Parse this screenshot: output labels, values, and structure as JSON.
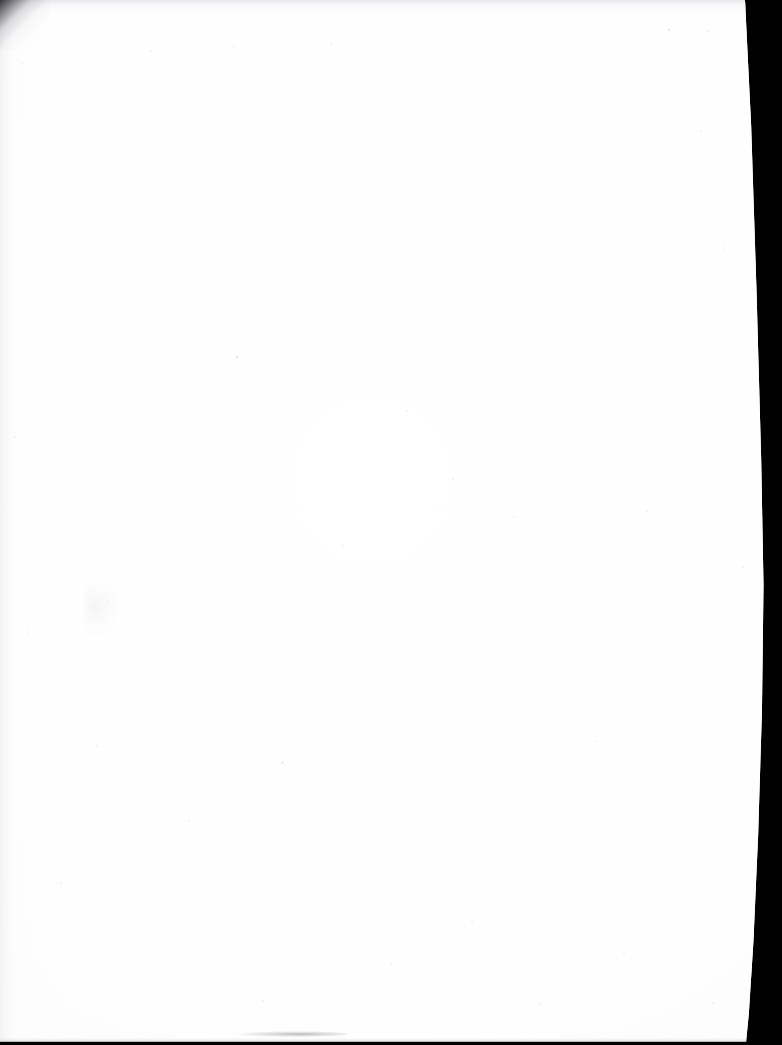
{
  "document": {
    "kind": "scanned-page",
    "content_text": "",
    "page_state": "blank",
    "orientation": "portrait"
  },
  "scan": {
    "width_px": 782,
    "height_px": 1045,
    "background_color": "#000000",
    "paper_color": "#ffffff",
    "paper_tone_color": "#fbfbfc"
  },
  "page": {
    "left_edge_px": 0,
    "top_edge_px": 0,
    "right_edge_top_px": 755,
    "right_edge_middle_px": 764,
    "right_edge_bottom_px": 746,
    "bottom_edge_px": 1045,
    "bleeds_off_left": true,
    "bleeds_off_top": true
  },
  "artifacts": {
    "corner_fold": {
      "name": "top-left-corner-shadow",
      "color": "#12121 6",
      "x": 0,
      "y": 0,
      "size_px": 50
    },
    "top_haze": {
      "name": "top-edge-light-haze",
      "color": "#dedee4",
      "height_px": 9
    },
    "bottom_band": {
      "name": "bottom-edge-dark-band",
      "color": "#0a0a0c",
      "height_px": 7
    },
    "bottom_smudge": {
      "name": "bottom-centre-grey-smudge",
      "color": "#7a7a82",
      "x": 236,
      "y": 1031,
      "width_px": 112,
      "height_px": 6
    },
    "left_streaks": {
      "name": "left-margin-scan-streaks",
      "color": "#e4e4e9",
      "width_px": 30
    },
    "grain_wisp": {
      "name": "left-centre-paper-grain",
      "x": 84,
      "y": 583
    },
    "specks": [
      {
        "x": 236,
        "y": 356,
        "size": 2
      },
      {
        "x": 668,
        "y": 29,
        "size": 2
      },
      {
        "x": 773,
        "y": 30,
        "size": 2
      },
      {
        "x": 107,
        "y": 601,
        "size": 2
      },
      {
        "x": 281,
        "y": 761,
        "size": 3
      },
      {
        "x": 21,
        "y": 62,
        "size": 2
      },
      {
        "x": 150,
        "y": 50,
        "size": 2
      },
      {
        "x": 233,
        "y": 45,
        "size": 2
      },
      {
        "x": 330,
        "y": 43,
        "size": 2
      },
      {
        "x": 14,
        "y": 436,
        "size": 2
      },
      {
        "x": 27,
        "y": 631,
        "size": 2
      },
      {
        "x": 60,
        "y": 882,
        "size": 2
      },
      {
        "x": 406,
        "y": 410,
        "size": 2
      },
      {
        "x": 452,
        "y": 478,
        "size": 2
      },
      {
        "x": 513,
        "y": 516,
        "size": 2
      },
      {
        "x": 646,
        "y": 510,
        "size": 2
      },
      {
        "x": 700,
        "y": 130,
        "size": 2
      },
      {
        "x": 723,
        "y": 247,
        "size": 2
      },
      {
        "x": 742,
        "y": 566,
        "size": 2
      },
      {
        "x": 188,
        "y": 820,
        "size": 2
      },
      {
        "x": 342,
        "y": 545,
        "size": 2
      },
      {
        "x": 594,
        "y": 740,
        "size": 2
      },
      {
        "x": 471,
        "y": 920,
        "size": 2
      },
      {
        "x": 623,
        "y": 952,
        "size": 2
      },
      {
        "x": 96,
        "y": 745,
        "size": 2
      },
      {
        "x": 390,
        "y": 963,
        "size": 2
      },
      {
        "x": 539,
        "y": 1003,
        "size": 2
      },
      {
        "x": 262,
        "y": 1000,
        "size": 2
      },
      {
        "x": 712,
        "y": 1002,
        "size": 2
      }
    ]
  }
}
